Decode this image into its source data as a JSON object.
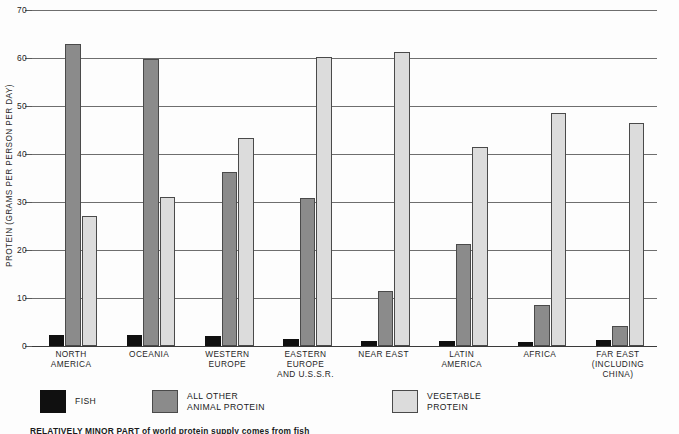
{
  "chart_data": {
    "type": "bar",
    "title": "",
    "xlabel": "",
    "ylabel": "PROTEIN (GRAMS PER PERSON PER DAY)",
    "ylim": [
      0,
      70
    ],
    "yticks": [
      0,
      10,
      20,
      30,
      40,
      50,
      60,
      70
    ],
    "ytick_labels": [
      "0",
      "10",
      "20",
      "30",
      "40",
      "50",
      "60",
      "70"
    ],
    "grid": true,
    "legend_position": "bottom",
    "categories": [
      "NORTH\nAMERICA",
      "OCEANIA",
      "WESTERN\nEUROPE",
      "EASTERN\nEUROPE\nAND U.S.S.R.",
      "NEAR EAST",
      "LATIN\nAMERICA",
      "AFRICA",
      "FAR EAST\n(INCLUDING\nCHINA)"
    ],
    "series": [
      {
        "name": "FISH",
        "color": "#101010",
        "values": [
          2.3,
          2.2,
          2.1,
          1.4,
          1.0,
          1.1,
          0.9,
          1.2
        ]
      },
      {
        "name": "ALL OTHER\nANIMAL PROTEIN",
        "color": "#8b8b8b",
        "values": [
          63.0,
          59.7,
          36.3,
          30.8,
          11.5,
          21.3,
          8.5,
          4.1
        ]
      },
      {
        "name": "VEGETABLE\nPROTEIN",
        "color": "#dcdcdc",
        "values": [
          27.0,
          31.0,
          43.4,
          60.3,
          61.2,
          41.5,
          48.5,
          46.5
        ]
      }
    ]
  },
  "legend": {
    "items": [
      {
        "label": "FISH",
        "swatch": "fish"
      },
      {
        "label": "ALL OTHER\nANIMAL PROTEIN",
        "swatch": "animal"
      },
      {
        "label": "VEGETABLE\nPROTEIN",
        "swatch": "vegetable"
      }
    ]
  },
  "caption": {
    "text": "RELATIVELY MINOR PART of world protein supply comes from fish"
  },
  "colors": {
    "fish": "#101010",
    "animal_protein": "#8b8b8b",
    "vegetable_protein": "#dcdcdc",
    "gridline": "#6e6e6e",
    "background": "#fdfdfd"
  }
}
